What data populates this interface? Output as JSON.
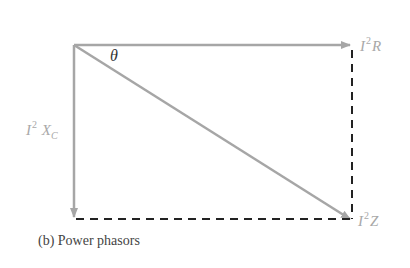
{
  "figure": {
    "caption": "(b) Power phasors",
    "angle_label": "θ",
    "labels": {
      "real_power": {
        "base": "I",
        "exp": "2",
        "suffix": "R"
      },
      "reactive_power": {
        "base": "I",
        "exp": "2",
        "suffix": "X",
        "sub": "C"
      },
      "apparent_power": {
        "base": "I",
        "exp": "2",
        "suffix": "Z"
      }
    },
    "colors": {
      "arrow": "#a6a6a6",
      "dashed": "#222222",
      "label": "#a8a8a8",
      "theta": "#333333"
    }
  }
}
